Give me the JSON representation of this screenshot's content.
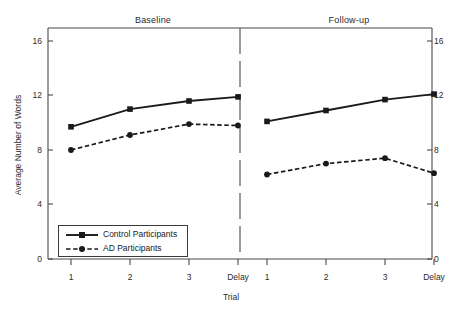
{
  "chart_data": {
    "type": "line",
    "title": "",
    "xlabel": "Trial",
    "ylabel": "Average Number of Words",
    "ylim": [
      0,
      16
    ],
    "yticks": [
      0,
      4,
      8,
      12,
      16
    ],
    "ytick_labels": [
      "0",
      "4",
      "8",
      "12",
      "16"
    ],
    "grid": false,
    "legend_position": "lower-left",
    "categories": [
      "1",
      "2",
      "3",
      "Delay"
    ],
    "panels": [
      {
        "name": "Baseline",
        "series": [
          {
            "name": "Control Participants",
            "values": [
              9.7,
              11.0,
              11.6,
              11.9
            ],
            "style": "solid",
            "marker": "square"
          },
          {
            "name": "AD Participants",
            "values": [
              8.0,
              9.1,
              9.9,
              9.8
            ],
            "style": "dashed",
            "marker": "circle"
          }
        ]
      },
      {
        "name": "Follow-up",
        "series": [
          {
            "name": "Control Participants",
            "values": [
              10.1,
              10.9,
              11.7,
              12.1
            ],
            "style": "solid",
            "marker": "square"
          },
          {
            "name": "AD Participants",
            "values": [
              6.2,
              7.0,
              7.4,
              6.3
            ],
            "style": "dashed",
            "marker": "circle"
          }
        ]
      }
    ],
    "legend": [
      {
        "label": "Control Participants",
        "style": "solid",
        "marker": "square"
      },
      {
        "label": "AD Participants",
        "style": "dashed",
        "marker": "circle"
      }
    ],
    "colors": {
      "line": "#1a1a1a",
      "axis": "#4a4a4a",
      "text": "#2b2b2b",
      "background": "#ffffff"
    }
  },
  "axes": {
    "y_left_ticks": [
      "16",
      "12",
      "8",
      "4",
      "0"
    ],
    "y_right_ticks": [
      "16",
      "12",
      "8",
      "4",
      "0"
    ],
    "x_ticks_baseline": [
      "1",
      "2",
      "3",
      "Delay"
    ],
    "x_ticks_followup": [
      "1",
      "2",
      "3",
      "Delay"
    ]
  },
  "titles": {
    "panel_left": "Baseline",
    "panel_right": "Follow-up",
    "y_axis": "Average Number of Words",
    "x_axis": "Trial"
  },
  "legend": {
    "control": "Control Participants",
    "ad": "AD Participants"
  }
}
